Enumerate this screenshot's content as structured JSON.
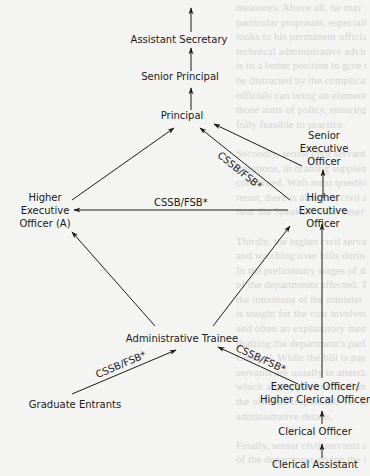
{
  "diagram": {
    "nodes": {
      "assistant_secretary": {
        "lines": [
          "Assistant Secretary"
        ]
      },
      "senior_principal": {
        "lines": [
          "Senior Principal"
        ]
      },
      "principal": {
        "lines": [
          "Principal"
        ]
      },
      "senior_executive_officer": {
        "lines": [
          "Senior",
          "Executive",
          "Officer"
        ]
      },
      "higher_executive_officer_a": {
        "lines": [
          "Higher",
          "Executive",
          "Officer (A)"
        ]
      },
      "higher_executive_officer": {
        "lines": [
          "Higher",
          "Executive",
          "Officer"
        ]
      },
      "administrative_trainee": {
        "lines": [
          "Administrative Trainee"
        ]
      },
      "graduate_entrants": {
        "lines": [
          "Graduate Entrants"
        ]
      },
      "executive_officer_hco": {
        "lines": [
          "Executive Officer/",
          "Higher Clerical Officer"
        ]
      },
      "clerical_officer": {
        "lines": [
          "Clerical Officer"
        ]
      },
      "clerical_assistant": {
        "lines": [
          "Clerical Assistant"
        ]
      }
    },
    "edges": [
      {
        "from": "senior_principal",
        "to": "assistant_secretary",
        "label": ""
      },
      {
        "from": "principal",
        "to": "senior_principal",
        "label": ""
      },
      {
        "from": "higher_executive_officer_a",
        "to": "principal",
        "label": ""
      },
      {
        "from": "higher_executive_officer",
        "to": "principal",
        "label": "CSSB/FSB*"
      },
      {
        "from": "senior_executive_officer",
        "to": "principal",
        "label": ""
      },
      {
        "from": "higher_executive_officer",
        "to": "senior_executive_officer",
        "label": ""
      },
      {
        "from": "higher_executive_officer",
        "to": "higher_executive_officer_a",
        "label": "CSSB/FSB*"
      },
      {
        "from": "administrative_trainee",
        "to": "higher_executive_officer_a",
        "label": ""
      },
      {
        "from": "administrative_trainee",
        "to": "higher_executive_officer",
        "label": ""
      },
      {
        "from": "graduate_entrants",
        "to": "administrative_trainee",
        "label": "CSSB/FSB*"
      },
      {
        "from": "executive_officer_hco",
        "to": "administrative_trainee",
        "label": "CSSB/FSB*"
      },
      {
        "from": "executive_officer_hco",
        "to": "higher_executive_officer",
        "label": ""
      },
      {
        "from": "clerical_officer",
        "to": "executive_officer_hco",
        "label": ""
      },
      {
        "from": "clerical_assistant",
        "to": "clerical_officer",
        "label": ""
      }
    ]
  },
  "background_text": [
    "measures. Above all, he may not fully appreciate the difficulties",
    "particular proposals, especially in its administration. Thus,",
    "looks to his permanent officials to provide him with expert",
    "technical administrative advice. In some respects, the civil servant",
    "is in a better position to give this opinion. While the minister may",
    "be distracted by the complications of a passing political crisis,",
    "officials can bring an element of continuity and consistency",
    "those aims of policy, ensuring that proposed objectives are",
    "fully feasible in practice.",
    "",
    "Secondly, senior civil servants play a major role in parliamentary",
    "questions, in drafting supplementaries and briefing the minister",
    "concerned. With most questions affecting a department and its",
    "remit, there is always a civil servant at hand to brief, the gallery",
    "near the Speaker's chair reserved for the purpose of officials.",
    "",
    "Thirdly, the higher civil servants are responsible for drafting",
    "and watching over bills during their passage through Parliament.",
    "In the preliminary stages of drafting, discussions take place with officials",
    "of the departments affected. The scope of the bill is decided by",
    "the intentions of the minister and Cabinet. Treasury approval",
    "is sought for the cost involved, outside interests are consulted",
    "and often an explanatory memorandum is prepared. In the actual",
    "drafting the department's parliamentary counsel work with Parliamentary",
    "Counsel. While the bill is passing through its various stages, civil",
    "servants are usually in attendance on the minister, a procedure",
    "which also applies in the Committee stage. When it becomes law,",
    "the officials responsible for administering the measure are vital",
    "administrative details.",
    "",
    "Finally, senior civil servants are in charge of the administration",
    "of the department giving the necessary directions which put the"
  ]
}
